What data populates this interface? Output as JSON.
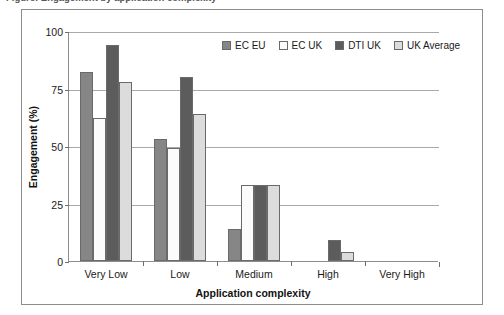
{
  "figure": {
    "caption_remnant": "Figure: Engagement by application complexity",
    "frame_color": "#8d8d8d",
    "background": "#ffffff"
  },
  "legend": {
    "position": "top-right-inside",
    "entries": [
      {
        "label": "EC EU",
        "color": "#868686"
      },
      {
        "label": "EC UK",
        "color": "#fbfbfb"
      },
      {
        "label": "DTI UK",
        "color": "#5c5c5c"
      },
      {
        "label": "UK Average",
        "color": "#dcdcdc"
      }
    ]
  },
  "chart_data": {
    "type": "bar",
    "title": "",
    "xlabel": "Application complexity",
    "ylabel": "Engagement (%)",
    "categories": [
      "Very Low",
      "Low",
      "Medium",
      "High",
      "Very High"
    ],
    "series": [
      {
        "name": "EC EU",
        "color": "#868686",
        "values": [
          82,
          53,
          14,
          0,
          0
        ]
      },
      {
        "name": "EC UK",
        "color": "#fbfbfb",
        "values": [
          62,
          49,
          33,
          0,
          0
        ]
      },
      {
        "name": "DTI UK",
        "color": "#5c5c5c",
        "values": [
          94,
          80,
          33,
          9,
          0
        ]
      },
      {
        "name": "UK Average",
        "color": "#dcdcdc",
        "values": [
          78,
          64,
          33,
          4,
          0
        ]
      }
    ],
    "ylim": [
      0,
      100
    ],
    "yticks": [
      0,
      25,
      50,
      75,
      100
    ],
    "ytick_labels": [
      "0",
      "25",
      "50",
      "75",
      "100"
    ],
    "grid": "horizontal",
    "legend_position": "top-right-inside"
  }
}
